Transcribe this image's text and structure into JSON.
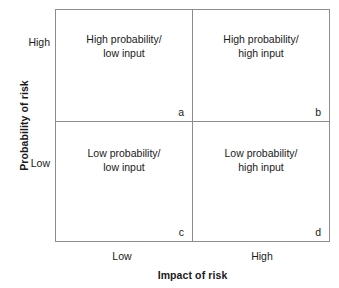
{
  "figure": {
    "background_color": "#ffffff",
    "line_color": "#8c8c8c",
    "text_color": "#1a1a1a"
  },
  "y_axis": {
    "title": "Probability of risk",
    "ticks": [
      {
        "label": "High"
      },
      {
        "label": "Low"
      }
    ]
  },
  "x_axis": {
    "title": "Impact of risk",
    "ticks": [
      {
        "label": "Low"
      },
      {
        "label": "High"
      }
    ]
  },
  "quadrants": [
    {
      "id": "a",
      "label": "High probability/\nlow input",
      "marker": "a",
      "probability": "High",
      "impact": "Low"
    },
    {
      "id": "b",
      "label": "High probability/\nhigh input",
      "marker": "b",
      "probability": "High",
      "impact": "High"
    },
    {
      "id": "c",
      "label": "Low probability/\nlow input",
      "marker": "c",
      "probability": "Low",
      "impact": "Low"
    },
    {
      "id": "d",
      "label": "Low probability/\nhigh input",
      "marker": "d",
      "probability": "Low",
      "impact": "High"
    }
  ],
  "chart_data": {
    "type": "table",
    "title": "",
    "xlabel": "Impact of risk",
    "ylabel": "Probability of risk",
    "x_categories": [
      "Low",
      "High"
    ],
    "y_categories": [
      "High",
      "Low"
    ],
    "grid": true,
    "legend": "none",
    "cells": [
      {
        "row": "High",
        "column": "Low",
        "marker": "a",
        "text": "High probability/ low input"
      },
      {
        "row": "High",
        "column": "High",
        "marker": "b",
        "text": "High probability/ high input"
      },
      {
        "row": "Low",
        "column": "Low",
        "marker": "c",
        "text": "Low probability/ low input"
      },
      {
        "row": "Low",
        "column": "High",
        "marker": "d",
        "text": "Low probability/ high input"
      }
    ]
  }
}
